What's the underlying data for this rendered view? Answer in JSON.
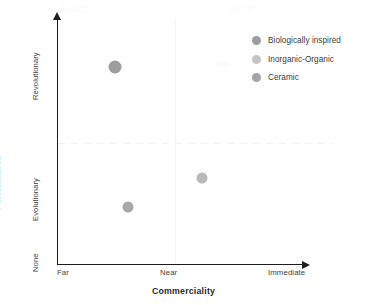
{
  "chart_data": {
    "type": "scatter",
    "title": "",
    "xlabel": "Commerciality",
    "ylabel": "Performance",
    "xticklabels": [
      "Far",
      "Near",
      "Immediate"
    ],
    "yticklabels": [
      "None",
      "Evolutionary",
      "Revolutionary"
    ],
    "xlim": [
      0,
      2
    ],
    "ylim": [
      0,
      2
    ],
    "grid": "faint quadrant dividers",
    "legend_position": "upper right",
    "series": [
      {
        "name": "Biologically inspired",
        "color": "#9d9d9d",
        "x": 0.49,
        "y": 1.66,
        "x_category": "Far-Near",
        "y_category": "Revolutionary",
        "marker_size": 13
      },
      {
        "name": "Inorganic-Organic",
        "color": "#b9b9b9",
        "x": 1.17,
        "y": 0.72,
        "x_category": "Near-Immediate",
        "y_category": "Evolutionary",
        "marker_size": 11
      },
      {
        "name": "Ceramic",
        "color": "#a8a8a8",
        "x": 0.8,
        "y": 0.38,
        "x_category": "Far-Near",
        "y_category": "Below Evolutionary",
        "marker_size": 11
      }
    ]
  },
  "legend": {
    "items": [
      {
        "label": "Biologically inspired",
        "color": "#9d9d9d"
      },
      {
        "label": "Inorganic-Organic",
        "color": "#c4c4c4"
      },
      {
        "label": "Ceramic",
        "color": "#a4a4a4"
      }
    ]
  },
  "axes": {
    "x_title": "Commerciality",
    "y_title": "Performance",
    "x_ticks": [
      "Far",
      "Near",
      "Immediate"
    ],
    "y_ticks": [
      "Revolutionary",
      "Evolutionary",
      "None"
    ]
  },
  "watermark": {
    "left": "Image",
    "right": "Image",
    "mid": "nm"
  },
  "points_render": [
    {
      "name": "point-biologically-inspired",
      "left": 115,
      "top": 67,
      "size": 13,
      "color": "#9d9d9d"
    },
    {
      "name": "point-inorganic-organic",
      "left": 202,
      "top": 178,
      "size": 11,
      "color": "#b9b9b9"
    },
    {
      "name": "point-ceramic",
      "left": 128,
      "top": 207,
      "size": 11,
      "color": "#a8a8a8"
    }
  ]
}
